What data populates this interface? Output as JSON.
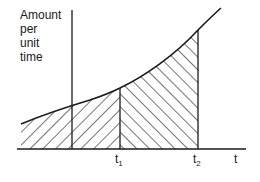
{
  "diagram": {
    "type": "area-under-curve",
    "y_axis_label_lines": [
      "Amount",
      "per",
      "unit",
      "time"
    ],
    "x_axis_label": "t",
    "markers": [
      {
        "label": "t",
        "sub": "1"
      },
      {
        "label": "t",
        "sub": "2"
      }
    ],
    "regions": [
      {
        "name": "area-before-t1",
        "hatch": "forward-diagonal"
      },
      {
        "name": "area-t1-to-t2",
        "hatch": "back-diagonal"
      }
    ],
    "curve": "increasing convex curve",
    "colors": {
      "line": "#1a1a1a",
      "background": "#ffffff"
    }
  }
}
